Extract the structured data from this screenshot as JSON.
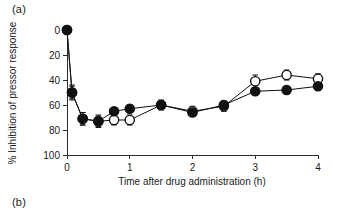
{
  "figure": {
    "panel_a_label": "(a)",
    "panel_b_label": "(b)"
  },
  "chart_data": {
    "type": "line",
    "title": "",
    "xlabel": "Time after drug administration (h)",
    "ylabel": "% Inhibition of pressor response",
    "xlim": [
      0,
      4
    ],
    "ylim": [
      0,
      100
    ],
    "y_axis_inverted": true,
    "xticks": [
      0,
      1,
      2,
      3,
      4
    ],
    "xticklabels": [
      "0",
      "1",
      "2",
      "3",
      "4"
    ],
    "yticks": [
      0,
      20,
      40,
      60,
      80,
      100
    ],
    "yticklabels": [
      "0",
      "20",
      "40",
      "60",
      "80",
      "100"
    ],
    "grid": false,
    "legend": "none",
    "error_bars": "SEM",
    "series": [
      {
        "name": "open-circle-series",
        "marker": "open-circle",
        "x": [
          0,
          0.08,
          0.25,
          0.5,
          0.75,
          1,
          1.5,
          2,
          2.5,
          3,
          3.5,
          4
        ],
        "values": [
          0,
          50,
          71,
          73,
          72,
          72,
          60,
          65,
          61,
          41,
          36,
          39
        ],
        "errors": [
          0,
          6,
          5,
          5,
          4,
          4,
          4,
          4,
          4,
          5,
          4,
          4
        ]
      },
      {
        "name": "filled-circle-series",
        "marker": "filled-circle",
        "x": [
          0,
          0.08,
          0.25,
          0.5,
          0.75,
          1,
          1.5,
          2,
          2.5,
          3,
          3.5,
          4
        ],
        "values": [
          0,
          50,
          71,
          73,
          65,
          63,
          60,
          66,
          60,
          49,
          48,
          45
        ],
        "errors": [
          0,
          5,
          5,
          4,
          3,
          3,
          3,
          3,
          3,
          3,
          3,
          3
        ]
      }
    ]
  }
}
